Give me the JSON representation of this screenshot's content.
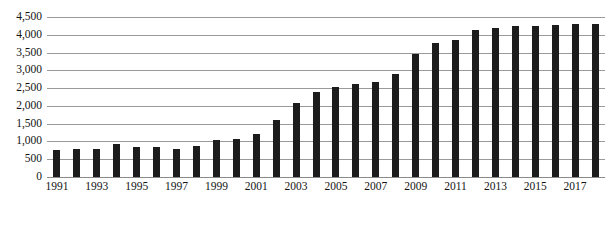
{
  "chart_data": {
    "type": "bar",
    "title": "",
    "subtitle": "",
    "xlabel": "",
    "ylabel": "",
    "grid": true,
    "legend": false,
    "ylim": [
      0,
      4500
    ],
    "ytick_step": 500,
    "ytick_labels": [
      "4,500",
      "4,000",
      "3,500",
      "3,000",
      "2,500",
      "2,000",
      "1,500",
      "1,000",
      "500",
      "0"
    ],
    "ytick_values": [
      4500,
      4000,
      3500,
      3000,
      2500,
      2000,
      1500,
      1000,
      500,
      0
    ],
    "bar_color": "#1c1c1c",
    "categories": [
      "1991",
      "1992",
      "1993",
      "1994",
      "1995",
      "1996",
      "1997",
      "1998",
      "1999",
      "2000",
      "2001",
      "2002",
      "2003",
      "2004",
      "2005",
      "2006",
      "2007",
      "2008",
      "2009",
      "2010",
      "2011",
      "2012",
      "2013",
      "2014",
      "2015",
      "2016",
      "2017",
      "2018"
    ],
    "visible_xtick_labels": [
      "1991",
      "1993",
      "1995",
      "1997",
      "1999",
      "2001",
      "2003",
      "2005",
      "2007",
      "2009",
      "2011",
      "2013",
      "2015",
      "2017"
    ],
    "values": [
      760,
      790,
      800,
      930,
      850,
      840,
      800,
      860,
      1050,
      1080,
      1220,
      1600,
      2080,
      2400,
      2530,
      2620,
      2670,
      2900,
      3470,
      3780,
      3860,
      4140,
      4190,
      4240,
      4260,
      4280,
      4300,
      4310
    ]
  },
  "axes": {
    "y_axis_name": "y-axis",
    "x_axis_name": "x-axis"
  }
}
